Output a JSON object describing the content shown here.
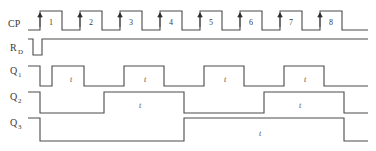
{
  "diagram": {
    "line_color": "#4a4a4a",
    "text_color": "#3a3a3a",
    "background": "#ffffff"
  },
  "signals": [
    {
      "key": "cp",
      "name": "CP",
      "base": "CP",
      "sub": "",
      "label_x": 8,
      "label_y": 24,
      "baseline_y": 30,
      "high_y": 11
    },
    {
      "key": "rd",
      "name": "RD",
      "base": "R",
      "sub": "D",
      "label_x": 10,
      "label_y": 48,
      "baseline_y": 55,
      "high_y": 39
    },
    {
      "key": "q1",
      "name": "Q1",
      "base": "Q",
      "sub": "1",
      "label_x": 10,
      "label_y": 71,
      "baseline_y": 86,
      "high_y": 66
    },
    {
      "key": "q2",
      "name": "Q2",
      "base": "Q",
      "sub": "2",
      "label_x": 10,
      "label_y": 97,
      "baseline_y": 113,
      "high_y": 92
    },
    {
      "key": "q3",
      "name": "Q3",
      "base": "Q",
      "sub": "3",
      "label_x": 10,
      "label_y": 122,
      "baseline_y": 141,
      "high_y": 118
    }
  ],
  "axis": {
    "x_start": 28,
    "x_end": 368,
    "clock_period": 40,
    "pulse_width": 22,
    "first_rise_x": 40
  },
  "clock_pulses": [
    {
      "number": "1",
      "rise_x": 40,
      "fall_x": 62,
      "label_x": 51
    },
    {
      "number": "2",
      "rise_x": 80,
      "fall_x": 102,
      "label_x": 91
    },
    {
      "number": "3",
      "rise_x": 120,
      "fall_x": 142,
      "label_x": 131
    },
    {
      "number": "4",
      "rise_x": 160,
      "fall_x": 182,
      "label_x": 171
    },
    {
      "number": "5",
      "rise_x": 200,
      "fall_x": 222,
      "label_x": 211
    },
    {
      "number": "6",
      "rise_x": 240,
      "fall_x": 262,
      "label_x": 251
    },
    {
      "number": "7",
      "rise_x": 280,
      "fall_x": 302,
      "label_x": 291
    },
    {
      "number": "8",
      "rise_x": 320,
      "fall_x": 342,
      "label_x": 331
    }
  ],
  "chart_data": {
    "type": "line",
    "xlabel": "",
    "ylabel": "",
    "series": [
      {
        "name": "CP",
        "description": "Clock with 8 positive pulses, rising edges trigger the counter",
        "transitions": [
          {
            "x": 28,
            "level": 0
          },
          {
            "x": 40,
            "level": 1
          },
          {
            "x": 62,
            "level": 0
          },
          {
            "x": 80,
            "level": 1
          },
          {
            "x": 102,
            "level": 0
          },
          {
            "x": 120,
            "level": 1
          },
          {
            "x": 142,
            "level": 0
          },
          {
            "x": 160,
            "level": 1
          },
          {
            "x": 182,
            "level": 0
          },
          {
            "x": 200,
            "level": 1
          },
          {
            "x": 222,
            "level": 0
          },
          {
            "x": 240,
            "level": 1
          },
          {
            "x": 262,
            "level": 0
          },
          {
            "x": 280,
            "level": 1
          },
          {
            "x": 302,
            "level": 0
          },
          {
            "x": 320,
            "level": 1
          },
          {
            "x": 342,
            "level": 0
          },
          {
            "x": 368,
            "level": 0
          }
        ]
      },
      {
        "name": "RD",
        "description": "Active-low reset pulse at the very beginning, high afterwards",
        "transitions": [
          {
            "x": 28,
            "level": 1
          },
          {
            "x": 33,
            "level": 0
          },
          {
            "x": 42,
            "level": 1
          },
          {
            "x": 368,
            "level": 1
          }
        ]
      },
      {
        "name": "Q1",
        "description": "LSB, toggles on every clock, period = 2 clock cycles",
        "transitions": [
          {
            "x": 28,
            "level": 1
          },
          {
            "x": 40,
            "level": 0
          },
          {
            "x": 52,
            "level": 1
          },
          {
            "x": 84,
            "level": 0
          },
          {
            "x": 124,
            "level": 1
          },
          {
            "x": 164,
            "level": 0
          },
          {
            "x": 204,
            "level": 1
          },
          {
            "x": 244,
            "level": 0
          },
          {
            "x": 284,
            "level": 1
          },
          {
            "x": 324,
            "level": 0
          },
          {
            "x": 368,
            "level": 0
          }
        ]
      },
      {
        "name": "Q2",
        "description": "Middle bit, period = 4 clock cycles",
        "transitions": [
          {
            "x": 28,
            "level": 1
          },
          {
            "x": 40,
            "level": 0
          },
          {
            "x": 104,
            "level": 1
          },
          {
            "x": 184,
            "level": 0
          },
          {
            "x": 264,
            "level": 1
          },
          {
            "x": 344,
            "level": 0
          },
          {
            "x": 368,
            "level": 0
          }
        ]
      },
      {
        "name": "Q3",
        "description": "MSB, period = 8 clock cycles",
        "transitions": [
          {
            "x": 28,
            "level": 1
          },
          {
            "x": 40,
            "level": 0
          },
          {
            "x": 184,
            "level": 1
          },
          {
            "x": 344,
            "level": 0
          },
          {
            "x": 368,
            "level": 0
          }
        ]
      }
    ]
  },
  "annotations": [
    {
      "text": "t",
      "x": 71,
      "y": 82
    },
    {
      "text": "t",
      "x": 145,
      "y": 82
    },
    {
      "text": "t",
      "x": 225,
      "y": 82
    },
    {
      "text": "t",
      "x": 305,
      "y": 82
    },
    {
      "text": "t",
      "x": 140,
      "y": 108
    },
    {
      "text": "t",
      "x": 300,
      "y": 108
    },
    {
      "text": "t",
      "x": 260,
      "y": 136
    }
  ]
}
